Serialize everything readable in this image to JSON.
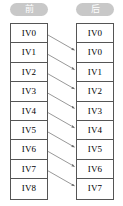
{
  "diagram": {
    "title_before": "前",
    "title_after": "后",
    "before": {
      "label": "前",
      "cells": [
        "IV0",
        "IV1",
        "IV2",
        "IV3",
        "IV4",
        "IV5",
        "IV6",
        "IV7",
        "IV8"
      ]
    },
    "after": {
      "label": "后",
      "cells": [
        "IV0",
        "IV0",
        "IV1",
        "IV2",
        "IV3",
        "IV4",
        "IV5",
        "IV6",
        "IV7"
      ]
    },
    "mappings": [
      {
        "from": "IV0",
        "from_index": 0,
        "to_index": 1
      },
      {
        "from": "IV1",
        "from_index": 1,
        "to_index": 2
      },
      {
        "from": "IV2",
        "from_index": 2,
        "to_index": 3
      },
      {
        "from": "IV3",
        "from_index": 3,
        "to_index": 4
      },
      {
        "from": "IV4",
        "from_index": 4,
        "to_index": 5
      },
      {
        "from": "IV5",
        "from_index": 5,
        "to_index": 6
      },
      {
        "from": "IV6",
        "from_index": 6,
        "to_index": 7
      },
      {
        "from": "IV7",
        "from_index": 7,
        "to_index": 8
      }
    ],
    "colors": {
      "pill_background": "#c8c8c8",
      "pill_text": "#ffffff",
      "cell_border": "#555555",
      "cell_text": "#000000",
      "arrow": "#6b6b6b",
      "page_background": "#ffffff"
    }
  }
}
